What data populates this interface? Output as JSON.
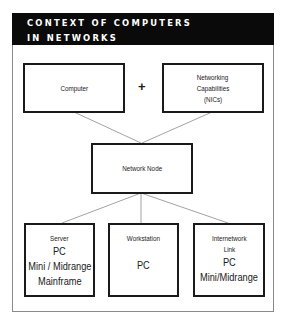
{
  "title": {
    "line1": "CONTEXT OF COMPUTERS",
    "line2": "IN NETWORKS"
  },
  "top_row": {
    "computer": {
      "label": "Computer"
    },
    "operator": "+",
    "networking": {
      "line1": "Networking",
      "line2": "Capabilities",
      "line3": "(NICs)"
    }
  },
  "middle": {
    "network_node": {
      "label": "Network Node"
    }
  },
  "bottom_row": {
    "server": {
      "heading": "Server",
      "items": [
        "PC",
        "Mini / Midrange",
        "Mainframe"
      ]
    },
    "workstation": {
      "heading": "Workstation",
      "items": [
        "PC"
      ]
    },
    "internetwork_link": {
      "heading_line1": "Internetwork",
      "heading_line2": "Link",
      "items": [
        "PC",
        "Mini/Midrange"
      ]
    }
  },
  "colors": {
    "header_bg": "#0a0a0a",
    "header_text": "#ffffff",
    "box_border": "#1a1a1a",
    "connector": "#8a8a8a",
    "frame_border": "#8a8a8a"
  }
}
